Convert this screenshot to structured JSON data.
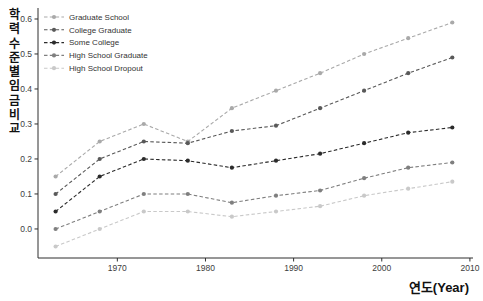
{
  "chart_data": {
    "type": "line",
    "title": "",
    "xlabel": "연도(Year)",
    "ylabel": "학력수준별임금비교",
    "line_style": "dashed",
    "marker": "circle",
    "grid": false,
    "legend_position": "upper-left",
    "xlim": [
      1961.0,
      2010.35
    ],
    "ylim": [
      -0.083,
      0.6314
    ],
    "x_ticks": [
      "1970",
      "1980",
      "1990",
      "2000",
      "2010"
    ],
    "x_tick_values": [
      1970,
      1980,
      1990,
      2000,
      2010
    ],
    "y_ticks": [
      "0.0",
      "0.1",
      "0.2",
      "0.3",
      "0.4",
      "0.5",
      "0.6"
    ],
    "y_tick_values": [
      0.0,
      0.1,
      0.2,
      0.3,
      0.4,
      0.5,
      0.6
    ],
    "x": [
      1963,
      1968,
      1973,
      1978,
      1983,
      1988,
      1993,
      1998,
      2003,
      2008
    ],
    "series": [
      {
        "name": "Graduate School",
        "color": "#a9a9a9",
        "values": [
          0.15,
          0.25,
          0.3,
          0.25,
          0.345,
          0.395,
          0.445,
          0.5,
          0.545,
          0.59
        ]
      },
      {
        "name": "College Graduate",
        "color": "#595959",
        "values": [
          0.1,
          0.2,
          0.25,
          0.245,
          0.28,
          0.295,
          0.345,
          0.395,
          0.445,
          0.49
        ]
      },
      {
        "name": "Some College",
        "color": "#2b2b2b",
        "values": [
          0.05,
          0.15,
          0.2,
          0.195,
          0.175,
          0.195,
          0.215,
          0.245,
          0.275,
          0.29
        ]
      },
      {
        "name": "High School Graduate",
        "color": "#7f7f7f",
        "values": [
          0.0,
          0.05,
          0.1,
          0.1,
          0.075,
          0.095,
          0.11,
          0.145,
          0.175,
          0.19
        ]
      },
      {
        "name": "High School Dropout",
        "color": "#c9c9c9",
        "values": [
          -0.05,
          0.0,
          0.05,
          0.05,
          0.035,
          0.05,
          0.065,
          0.095,
          0.115,
          0.135
        ]
      }
    ]
  },
  "colors": {
    "background": "#ffffff",
    "axis": "#2f2f2f",
    "tick_text": "#3d3d3d",
    "legend_text": "#333333"
  }
}
